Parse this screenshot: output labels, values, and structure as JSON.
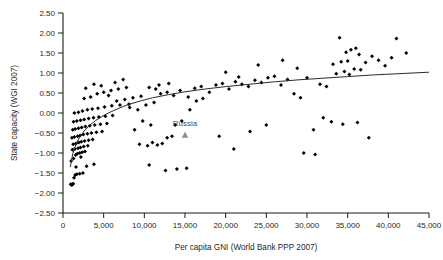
{
  "chart_data": {
    "type": "scatter",
    "title": "",
    "xlabel": "Per capita GNI (World Bank PPP 2007)",
    "ylabel": "State capacity (WGI 2007)",
    "xlim": [
      0,
      45000
    ],
    "ylim": [
      -2.5,
      2.5
    ],
    "xticks": [
      0,
      5000,
      10000,
      15000,
      20000,
      25000,
      30000,
      35000,
      40000,
      45000
    ],
    "xtick_labels": [
      "0",
      "5,000",
      "10,000",
      "15,000",
      "20,000",
      "25,000",
      "30,000",
      "35,000",
      "40,000",
      "45,000"
    ],
    "yticks": [
      -2.5,
      -2.0,
      -1.5,
      -1.0,
      -0.5,
      0.0,
      0.5,
      1.0,
      1.5,
      2.0,
      2.5
    ],
    "ytick_labels": [
      "-2.50",
      "-2.00",
      "-1.50",
      "-1.00",
      "-0.50",
      "0.00",
      "0.50",
      "1.00",
      "1.50",
      "2.00",
      "2.50"
    ],
    "grid": false,
    "legend": null,
    "marker": "diamond",
    "marker_color": "#000000",
    "trend": {
      "type": "logarithmic",
      "color": "#2b2b2b",
      "width": 1,
      "description": "Fitted log curve rising from about -1.35 at GNI 900 to about 1.02 at GNI 45,000",
      "points": [
        [
          900,
          -1.35
        ],
        [
          1200,
          -1.02
        ],
        [
          1600,
          -0.78
        ],
        [
          2000,
          -0.62
        ],
        [
          2600,
          -0.45
        ],
        [
          3200,
          -0.32
        ],
        [
          4000,
          -0.19
        ],
        [
          5000,
          -0.06
        ],
        [
          6000,
          0.04
        ],
        [
          7000,
          0.13
        ],
        [
          8000,
          0.21
        ],
        [
          9500,
          0.3
        ],
        [
          11000,
          0.38
        ],
        [
          13000,
          0.46
        ],
        [
          15000,
          0.53
        ],
        [
          17500,
          0.6
        ],
        [
          20000,
          0.66
        ],
        [
          23000,
          0.72
        ],
        [
          26000,
          0.78
        ],
        [
          29000,
          0.83
        ],
        [
          32000,
          0.87
        ],
        [
          35000,
          0.91
        ],
        [
          38000,
          0.95
        ],
        [
          41000,
          0.98
        ],
        [
          45000,
          1.02
        ]
      ]
    },
    "annotations": [
      {
        "label": "Russia",
        "x": 15000,
        "y": -0.55,
        "marker": "triangle",
        "marker_color": "#8c8c8c",
        "label_color": "#4d4d4d",
        "label_dy": 0.22
      }
    ],
    "points": [
      [
        950,
        -1.78
      ],
      [
        1050,
        -1.8
      ],
      [
        1150,
        -1.79
      ],
      [
        1250,
        -1.77
      ],
      [
        1350,
        -1.62
      ],
      [
        1500,
        -1.55
      ],
      [
        1700,
        -1.53
      ],
      [
        2050,
        -1.52
      ],
      [
        2450,
        -1.5
      ],
      [
        1600,
        -1.35
      ],
      [
        2900,
        -1.33
      ],
      [
        3800,
        -1.28
      ],
      [
        1000,
        -1.2
      ],
      [
        1300,
        -1.14
      ],
      [
        2200,
        -1.1
      ],
      [
        1550,
        -1.05
      ],
      [
        1750,
        -1.02
      ],
      [
        2050,
        -1.0
      ],
      [
        2350,
        -0.98
      ],
      [
        2700,
        -0.96
      ],
      [
        1150,
        -0.92
      ],
      [
        1450,
        -0.9
      ],
      [
        1850,
        -0.88
      ],
      [
        2150,
        -0.86
      ],
      [
        2550,
        -0.84
      ],
      [
        3050,
        -0.82
      ],
      [
        1250,
        -0.78
      ],
      [
        1600,
        -0.76
      ],
      [
        1950,
        -0.74
      ],
      [
        2250,
        -0.72
      ],
      [
        2650,
        -0.7
      ],
      [
        3150,
        -0.68
      ],
      [
        3650,
        -0.66
      ],
      [
        1100,
        -0.62
      ],
      [
        1400,
        -0.6
      ],
      [
        1800,
        -0.58
      ],
      [
        2100,
        -0.56
      ],
      [
        2500,
        -0.54
      ],
      [
        3000,
        -0.52
      ],
      [
        3500,
        -0.5
      ],
      [
        4100,
        -0.48
      ],
      [
        4800,
        -0.46
      ],
      [
        1200,
        -0.42
      ],
      [
        1500,
        -0.4
      ],
      [
        1900,
        -0.38
      ],
      [
        2300,
        -0.36
      ],
      [
        2750,
        -0.34
      ],
      [
        3300,
        -0.32
      ],
      [
        3900,
        -0.3
      ],
      [
        4600,
        -0.28
      ],
      [
        5400,
        -0.26
      ],
      [
        1300,
        -0.22
      ],
      [
        1700,
        -0.2
      ],
      [
        2150,
        -0.18
      ],
      [
        2600,
        -0.16
      ],
      [
        3150,
        -0.14
      ],
      [
        3750,
        -0.12
      ],
      [
        4400,
        -0.1
      ],
      [
        5200,
        -0.08
      ],
      [
        6100,
        -0.06
      ],
      [
        1400,
        0.0
      ],
      [
        1900,
        0.02
      ],
      [
        2400,
        0.05
      ],
      [
        3000,
        0.08
      ],
      [
        3600,
        0.1
      ],
      [
        4300,
        0.12
      ],
      [
        5100,
        0.15
      ],
      [
        6000,
        0.18
      ],
      [
        7000,
        0.2
      ],
      [
        8100,
        0.22
      ],
      [
        2600,
        0.36
      ],
      [
        3400,
        0.4
      ],
      [
        4200,
        0.48
      ],
      [
        5000,
        0.52
      ],
      [
        5900,
        0.56
      ],
      [
        6800,
        0.6
      ],
      [
        7800,
        0.64
      ],
      [
        3800,
        0.72
      ],
      [
        4700,
        0.68
      ],
      [
        6400,
        0.76
      ],
      [
        7400,
        0.84
      ],
      [
        2800,
        0.62
      ],
      [
        5600,
        0.44
      ],
      [
        6600,
        0.3
      ],
      [
        7600,
        0.34
      ],
      [
        8600,
        0.38
      ],
      [
        9600,
        0.42
      ],
      [
        8200,
        0.14
      ],
      [
        9200,
        0.08
      ],
      [
        10200,
        0.2
      ],
      [
        11200,
        0.26
      ],
      [
        9800,
        -0.2
      ],
      [
        10800,
        -0.3
      ],
      [
        8800,
        -0.42
      ],
      [
        9400,
        -0.78
      ],
      [
        10400,
        -0.82
      ],
      [
        11000,
        -0.74
      ],
      [
        11600,
        -0.8
      ],
      [
        12200,
        -0.76
      ],
      [
        10600,
        -1.3
      ],
      [
        12800,
        -0.62
      ],
      [
        13400,
        -0.58
      ],
      [
        14000,
        -1.4
      ],
      [
        15200,
        -1.38
      ],
      [
        12600,
        -1.44
      ],
      [
        13800,
        -0.3
      ],
      [
        14600,
        -0.2
      ],
      [
        15600,
        0.08
      ],
      [
        16400,
        0.3
      ],
      [
        17200,
        0.36
      ],
      [
        12000,
        0.48
      ],
      [
        12800,
        0.52
      ],
      [
        13600,
        0.44
      ],
      [
        14400,
        0.56
      ],
      [
        15400,
        0.4
      ],
      [
        16200,
        0.62
      ],
      [
        17000,
        0.66
      ],
      [
        11400,
        0.6
      ],
      [
        10600,
        0.64
      ],
      [
        13000,
        0.74
      ],
      [
        11800,
        0.7
      ],
      [
        18000,
        0.52
      ],
      [
        18800,
        0.7
      ],
      [
        19600,
        0.74
      ],
      [
        20400,
        0.6
      ],
      [
        21200,
        0.78
      ],
      [
        22000,
        0.72
      ],
      [
        22800,
        0.66
      ],
      [
        20000,
        1.02
      ],
      [
        21600,
        0.9
      ],
      [
        23600,
        0.82
      ],
      [
        24400,
        0.76
      ],
      [
        25200,
        0.88
      ],
      [
        26000,
        0.92
      ],
      [
        19200,
        -0.58
      ],
      [
        21000,
        -0.9
      ],
      [
        23000,
        -0.46
      ],
      [
        25000,
        -0.3
      ],
      [
        26800,
        0.7
      ],
      [
        27600,
        0.84
      ],
      [
        28400,
        0.48
      ],
      [
        29200,
        0.38
      ],
      [
        30000,
        0.88
      ],
      [
        27000,
        1.32
      ],
      [
        28800,
        1.12
      ],
      [
        24000,
        1.2
      ],
      [
        30800,
        -0.42
      ],
      [
        29600,
        -1.0
      ],
      [
        31600,
        0.72
      ],
      [
        32400,
        0.66
      ],
      [
        33200,
        1.22
      ],
      [
        34000,
        1.88
      ],
      [
        34800,
        1.52
      ],
      [
        35400,
        1.58
      ],
      [
        36000,
        1.62
      ],
      [
        34200,
        1.28
      ],
      [
        35000,
        1.3
      ],
      [
        35800,
        1.1
      ],
      [
        36600,
        1.08
      ],
      [
        36400,
        1.46
      ],
      [
        37200,
        1.26
      ],
      [
        38000,
        1.42
      ],
      [
        38800,
        1.32
      ],
      [
        39600,
        1.18
      ],
      [
        33600,
        0.98
      ],
      [
        34600,
        1.04
      ],
      [
        35200,
        0.96
      ],
      [
        33000,
        -0.22
      ],
      [
        34400,
        -0.28
      ],
      [
        36200,
        -0.24
      ],
      [
        37600,
        -0.62
      ],
      [
        41000,
        1.86
      ],
      [
        42200,
        1.5
      ],
      [
        40400,
        1.38
      ],
      [
        31000,
        -1.04
      ],
      [
        32000,
        -0.12
      ]
    ]
  }
}
